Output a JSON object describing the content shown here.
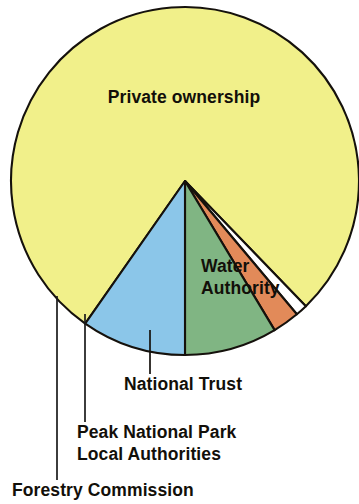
{
  "chart_data": {
    "type": "pie",
    "title": "",
    "subtitle": "",
    "xlabel": "",
    "ylabel": "",
    "legend_position": "none",
    "grid": false,
    "total_degrees": 360,
    "categories": [
      "Private ownership",
      "Forestry Commission",
      "Peak National Park Local Authorities",
      "National Trust",
      "Water Authority"
    ],
    "values": [
      78.1,
      1.1,
      2.5,
      8.6,
      9.7
    ],
    "values_unit": "percent",
    "slices": [
      {
        "label": "Private ownership",
        "percent": 78.1,
        "start_angle": 215,
        "end_angle": 496,
        "sweep": 281,
        "color": "#f1f08a",
        "label_placement": "inside",
        "label_x": 184,
        "label_y": 103
      },
      {
        "label": "Forestry Commission",
        "percent": 1.1,
        "start_angle": 136,
        "end_angle": 140,
        "sweep": 4,
        "color": "#ffffff",
        "label_placement": "callout",
        "label_x": 12,
        "label_y": 496
      },
      {
        "label": "Peak National Park",
        "label_line2": "Local Authorities",
        "percent": 2.5,
        "start_angle": 140,
        "end_angle": 149,
        "sweep": 9,
        "color": "#e28a59",
        "label_placement": "callout",
        "label_x": 77,
        "label_y": 438
      },
      {
        "label": "National Trust",
        "percent": 8.6,
        "start_angle": 149,
        "end_angle": 180,
        "sweep": 31,
        "color": "#80b583",
        "label_placement": "callout",
        "label_x": 124,
        "label_y": 390
      },
      {
        "label": "Water Authority",
        "label_line1": "Water",
        "label_line2": "Authority",
        "percent": 9.7,
        "start_angle": 180,
        "end_angle": 215,
        "sweep": 35,
        "color": "#8bc6e9",
        "label_placement": "inside",
        "label_x": 201,
        "label_y": 272
      }
    ],
    "colors": {
      "private_ownership": "#f1f08a",
      "forestry_commission": "#ffffff",
      "peak_national_park": "#e28a59",
      "national_trust": "#80b583",
      "water_authority": "#8bc6e9",
      "outline": "#15110c",
      "background": "#ffffff",
      "text": "#120f09"
    },
    "geometry": {
      "center_x": 185,
      "center_y": 181,
      "radius": 174
    }
  },
  "labels": {
    "private_ownership": "Private ownership",
    "water_authority_line1": "Water",
    "water_authority_line2": "Authority",
    "national_trust": "National Trust",
    "peak_national_park_line1": "Peak National Park",
    "peak_national_park_line2": "Local Authorities",
    "forestry_commission": "Forestry Commission"
  }
}
